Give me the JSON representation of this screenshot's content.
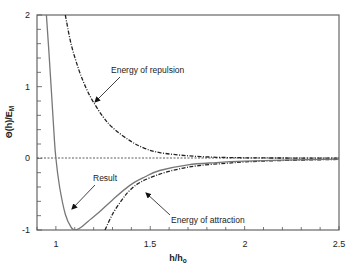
{
  "chart_data": {
    "type": "line",
    "title": "",
    "xlabel": "h/h0",
    "ylabel": "Θ(h)/EM",
    "xlim": [
      0.9,
      2.5
    ],
    "ylim": [
      -1,
      2
    ],
    "x_ticks": [
      {
        "value": 1,
        "label": "1"
      },
      {
        "value": 1.5,
        "label": "1.5"
      },
      {
        "value": 2,
        "label": "2"
      },
      {
        "value": 2.5,
        "label": "2.5"
      }
    ],
    "y_ticks": [
      {
        "value": 2,
        "label": "2"
      },
      {
        "value": 1,
        "label": "1"
      },
      {
        "value": 0,
        "label": "0"
      },
      {
        "value": -1,
        "label": "-1"
      }
    ],
    "grid": false,
    "legend": "none (inline annotations)",
    "series": [
      {
        "name": "Energy of repulsion",
        "style": "dash-dot",
        "x": [
          1.05,
          1.08,
          1.12,
          1.16,
          1.2,
          1.25,
          1.3,
          1.39,
          1.47,
          1.55,
          1.7,
          1.85,
          2.0,
          2.2,
          2.5
        ],
        "y": [
          2.0,
          1.6,
          1.25,
          0.98,
          0.78,
          0.58,
          0.43,
          0.25,
          0.14,
          0.08,
          0.035,
          0.015,
          0.008,
          0.004,
          0.002
        ]
      },
      {
        "name": "Energy of attraction",
        "style": "dash-dot",
        "x": [
          1.26,
          1.3,
          1.35,
          1.39,
          1.45,
          1.55,
          1.65,
          1.76,
          1.9,
          2.0,
          2.2,
          2.5
        ],
        "y": [
          -1.0,
          -0.78,
          -0.58,
          -0.45,
          -0.33,
          -0.22,
          -0.15,
          -0.1,
          -0.07,
          -0.05,
          -0.03,
          -0.015
        ]
      },
      {
        "name": "Result",
        "style": "solid",
        "x": [
          0.95,
          0.97,
          0.99,
          1.0,
          1.02,
          1.05,
          1.08,
          1.1,
          1.13,
          1.17,
          1.23,
          1.3,
          1.39,
          1.47,
          1.55,
          1.7,
          1.85,
          2.0,
          2.2,
          2.5
        ],
        "y": [
          2.0,
          1.2,
          0.35,
          0.0,
          -0.4,
          -0.78,
          -0.96,
          -1.0,
          -0.97,
          -0.88,
          -0.75,
          -0.58,
          -0.38,
          -0.26,
          -0.17,
          -0.09,
          -0.06,
          -0.04,
          -0.025,
          -0.012
        ]
      }
    ],
    "reference_lines": [
      {
        "orientation": "horizontal",
        "y": 0,
        "style": "dashed"
      }
    ],
    "annotations": [
      {
        "text": "Energy of repulsion",
        "points_to": "repulsion curve"
      },
      {
        "text": "Result",
        "points_to": "result curve"
      },
      {
        "text": "Energy of attraction",
        "points_to": "attraction curve"
      }
    ]
  },
  "labels": {
    "x_axis": "h/h",
    "x_axis_sub": "o",
    "y_axis_main": "Θ(h)/E",
    "y_axis_sub": "M",
    "ann_repulsion": "Energy of repulsion",
    "ann_result": "Result",
    "ann_attraction": "Energy of attraction",
    "xt_1": "1",
    "xt_15": "1.5",
    "xt_2": "2",
    "xt_25": "2.5",
    "yt_2": "2",
    "yt_1": "1",
    "yt_0": "0",
    "yt_m1": "-1"
  }
}
